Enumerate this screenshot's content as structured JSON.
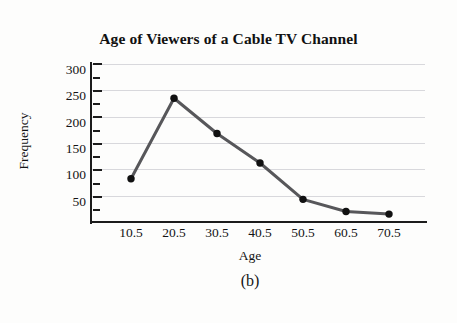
{
  "figure": {
    "caption": "(b)",
    "background": "#fdfdfc"
  },
  "chart_data": {
    "type": "line",
    "title": "Age of Viewers of a Cable TV Channel",
    "xlabel": "Age",
    "ylabel": "Frequency",
    "x": [
      10.5,
      20.5,
      30.5,
      40.5,
      50.5,
      60.5,
      70.5
    ],
    "categories": [
      "10.5",
      "20.5",
      "30.5",
      "40.5",
      "50.5",
      "60.5",
      "70.5"
    ],
    "values": [
      82,
      235,
      168,
      112,
      43,
      20,
      15
    ],
    "series": [
      {
        "name": "Frequency",
        "values": [
          82,
          235,
          168,
          112,
          43,
          20,
          15
        ]
      }
    ],
    "xlim": [
      5.5,
      80.5
    ],
    "ylim": [
      0,
      300
    ],
    "yticks": [
      50,
      100,
      150,
      200,
      250,
      300
    ],
    "ytick_labels": [
      "50",
      "100",
      "150",
      "200",
      "250",
      "300"
    ],
    "xtick_labels": [
      "10.5",
      "20.5",
      "30.5",
      "40.5",
      "50.5",
      "60.5",
      "70.5"
    ],
    "grid": true,
    "grid_axis": "y",
    "grid_color": "#d8d8dc",
    "legend": null,
    "legend_position": "none",
    "line_color": "#57575a",
    "line_width": 3,
    "marker": "circle",
    "marker_color": "#111111",
    "marker_size": 5,
    "axis_color": "#1c1c1c"
  }
}
